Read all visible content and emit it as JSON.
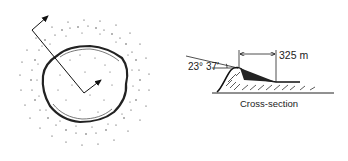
{
  "figure": {
    "plan_view": {
      "description": "Crater plan view with stippled ejecta blanket and two direction arrows"
    },
    "cross_section": {
      "angle_label": "23° 37′",
      "width_label": "325 m",
      "caption": "Cross-section"
    }
  }
}
